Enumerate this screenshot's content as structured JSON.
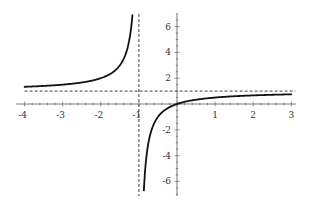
{
  "chart_data": {
    "type": "line",
    "title": "",
    "xlabel": "",
    "ylabel": "",
    "function": "y = x/(x+1)",
    "xlim": [
      -4,
      3
    ],
    "ylim": [
      -7,
      7
    ],
    "grid": false,
    "legend": null,
    "x_ticks": [
      "-4",
      "-3",
      "-2",
      "-1",
      "1",
      "2",
      "3"
    ],
    "y_ticks": [
      "6",
      "4",
      "2",
      "-2",
      "-4",
      "-6"
    ],
    "asymptotes": [
      {
        "type": "vertical",
        "x": -1,
        "style": "dashed"
      },
      {
        "type": "horizontal",
        "y": 1,
        "style": "dashed"
      }
    ],
    "series": [
      {
        "name": "left branch",
        "x": [
          -4,
          -3.5,
          -3,
          -2.5,
          -2,
          -1.75,
          -1.5,
          -1.35,
          -1.25,
          -1.2,
          -1.17
        ],
        "values": [
          1.33,
          1.4,
          1.5,
          1.67,
          2,
          2.33,
          3,
          3.86,
          5,
          6,
          6.9
        ]
      },
      {
        "name": "right branch",
        "x": [
          -0.87,
          -0.85,
          -0.8,
          -0.7,
          -0.6,
          -0.5,
          -0.3,
          0,
          0.5,
          1,
          1.5,
          2,
          2.5,
          3
        ],
        "values": [
          -6.7,
          -5.67,
          -4,
          -2.33,
          -1.5,
          -1,
          -0.43,
          0,
          0.33,
          0.5,
          0.6,
          0.67,
          0.71,
          0.75
        ]
      }
    ],
    "colors": {
      "curve": "#111111",
      "axes": "#555555",
      "asymptote": "#444444"
    }
  }
}
